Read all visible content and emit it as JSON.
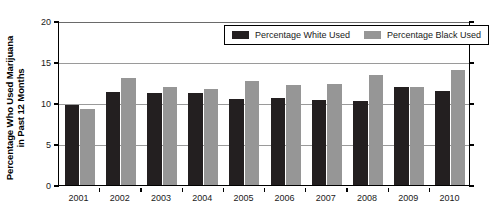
{
  "chart_data": {
    "type": "bar",
    "title": "",
    "subtitle": "",
    "xlabel": "",
    "ylabel": "Percentage Who Used Marijuana in Past 12 Months",
    "ylabel_lines": [
      "Percentage Who Used Marijuana",
      "in Past 12 Months"
    ],
    "categories": [
      "2001",
      "2002",
      "2003",
      "2004",
      "2005",
      "2006",
      "2007",
      "2008",
      "2009",
      "2010"
    ],
    "series": [
      {
        "name": "Percentage White Used",
        "color": "#231f20",
        "values": [
          9.8,
          11.3,
          11.2,
          11.2,
          10.5,
          10.6,
          10.4,
          10.2,
          11.9,
          11.5
        ]
      },
      {
        "name": "Percentage Black Used",
        "color": "#969696",
        "values": [
          9.3,
          13.1,
          11.9,
          11.7,
          12.7,
          12.2,
          12.3,
          13.4,
          12.0,
          14.0
        ]
      }
    ],
    "ylim": [
      0,
      20
    ],
    "yticks": [
      0,
      5,
      10,
      15,
      20
    ],
    "ytick_labels": [
      "0",
      "5",
      "10",
      "15",
      "20"
    ],
    "grid": true,
    "grid_axis": "y",
    "legend_position": "top-right-inside"
  },
  "legend": {
    "items": [
      {
        "label": "Percentage White Used",
        "color": "#231f20"
      },
      {
        "label": "Percentage Black Used",
        "color": "#969696"
      }
    ]
  },
  "colors": {
    "white_used": "#231f20",
    "black_used": "#969696",
    "axis": "#000000",
    "gridline": "#9a9a9a",
    "background": "#ffffff"
  }
}
